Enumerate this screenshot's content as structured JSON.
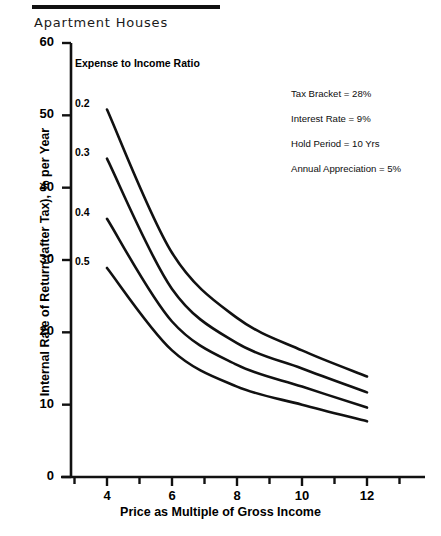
{
  "header": {
    "title": "Apartment Houses"
  },
  "chart_data": {
    "type": "line",
    "title": "Apartment Houses",
    "xlabel": "Price as Multiple of Gross Income",
    "ylabel": "Internal Rate of Return (after Tax), % per Year",
    "xlim": [
      3,
      13
    ],
    "ylim": [
      0,
      60
    ],
    "xticks": [
      4,
      6,
      8,
      10,
      12
    ],
    "yticks": [
      0,
      10,
      20,
      30,
      40,
      50,
      60
    ],
    "xtick_labels": [
      "4",
      "6",
      "8",
      "10",
      "12"
    ],
    "ytick_labels": [
      "0",
      "10",
      "20",
      "30",
      "40",
      "50",
      "60"
    ],
    "x": [
      4,
      6,
      8,
      10,
      12
    ],
    "grid": false,
    "legend_position": "inline-left",
    "legend_title": "Expense to Income Ratio",
    "series": [
      {
        "name": "0.2",
        "label": "0.2",
        "values": [
          50.8,
          31.0,
          22.0,
          17.5,
          13.9
        ]
      },
      {
        "name": "0.3",
        "label": "0.3",
        "values": [
          44.0,
          26.0,
          18.5,
          15.0,
          11.7
        ]
      },
      {
        "name": "0.4",
        "label": "0.4",
        "values": [
          35.7,
          21.5,
          15.5,
          12.5,
          9.6
        ]
      },
      {
        "name": "0.5",
        "label": "0.5",
        "values": [
          28.9,
          17.5,
          12.5,
          10.0,
          7.7
        ]
      }
    ],
    "annotations": [
      "Tax Bracket = 28%",
      "Interest Rate = 9%",
      "Hold Period = 10 Yrs",
      "Annual Appreciation = 5%"
    ]
  },
  "colors": {
    "ink": "#111111",
    "background": "#ffffff"
  }
}
